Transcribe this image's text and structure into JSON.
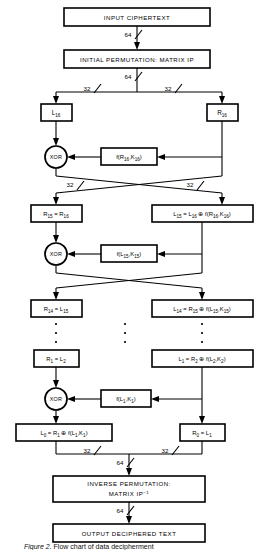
{
  "diagram": {
    "stroke_color": "#000000",
    "background_color": "#ffffff",
    "boxes": {
      "input_ciphertext": "INPUT CIPHERTEXT",
      "initial_permutation": "INITIAL PERMUTATION: MATRIX IP",
      "l16": "L",
      "l16_sub": "16",
      "r16": "R",
      "r16_sub": "16",
      "f_r16_k16": "f(R",
      "f_r16_k16_sub1": "16",
      "f_r16_k16_mid": ",K",
      "f_r16_k16_sub2": "16",
      "f_r16_k16_end": ")",
      "r15_eq": "R",
      "r15_sub": "15",
      "r15_eq_mid": " = R",
      "r15_sub2": "16",
      "l15_eq": "L",
      "l15_sub": "15",
      "l15_mid": " = L",
      "l15_sub2": "16",
      "l15_xor": " ⊕ f(R",
      "l15_sub3": "16",
      "l15_mid2": ",K",
      "l15_sub4": "16",
      "l15_end": ")",
      "f_l15_k15": "f(L",
      "f_l15_k15_sub1": "15",
      "f_l15_k15_mid": ",K",
      "f_l15_k15_sub2": "15",
      "f_l15_k15_end": ")",
      "r14_eq": "R",
      "r14_sub": "14",
      "r14_mid": " = L",
      "r14_sub2": "15",
      "l14_eq": "L",
      "l14_sub": "14",
      "l14_mid": " = R",
      "l14_sub2": "15",
      "l14_xor": " ⊕ f(L",
      "l14_sub3": "15",
      "l14_mid2": ",K",
      "l14_sub4": "15",
      "l14_end": ")",
      "r1_eq": "R",
      "r1_sub": "1",
      "r1_mid": " = L",
      "r1_sub2": "2",
      "l1_eq": "L",
      "l1_sub": "1",
      "l1_mid": " = R",
      "l1_sub2": "2",
      "l1_xor": " ⊕ f(L",
      "l1_sub3": "2",
      "l1_mid2": ",K",
      "l1_sub4": "2",
      "l1_end": ")",
      "f_l1_k1": "f(L",
      "f_l1_k1_sub1": "1",
      "f_l1_k1_mid": ",K",
      "f_l1_k1_sub2": "1",
      "f_l1_k1_end": ")",
      "l0_eq": "L",
      "l0_sub": "0",
      "l0_mid": " = R",
      "l0_sub2": "1",
      "l0_xor": " ⊕ f(L",
      "l0_sub3": "1",
      "l0_mid2": ",K",
      "l0_sub4": "1",
      "l0_end": ")",
      "r0_eq": "R",
      "r0_sub": "0",
      "r0_mid": " = L",
      "r0_sub2": "1",
      "inverse_permutation_line1": "INVERSE PERMUTATION:",
      "inverse_permutation_line2": "MATRIX IP",
      "inverse_permutation_sup": "−1",
      "output_text": "OUTPUT DECIPHERED TEXT"
    },
    "xor_label": "XOR",
    "bit_labels": {
      "b64": "64",
      "b32": "32"
    },
    "ellipsis_note": "vertical ellipsis indicating rounds 14 through 2 omitted"
  },
  "caption": {
    "figure_prefix": "Figure",
    "figure_number": "2.",
    "figure_text": "Flow chart of data decipherment"
  }
}
